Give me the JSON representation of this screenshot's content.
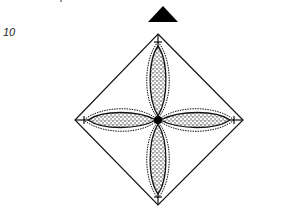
{
  "step": {
    "number": "10"
  },
  "diagram": {
    "type": "origami-fold-diagram",
    "indicator_icon": "filled-triangle-up",
    "petals": [
      "top",
      "right",
      "bottom",
      "left"
    ],
    "colors": {
      "line": "#111111",
      "fill": "#ffffff",
      "stipple": "#333333",
      "indicator": "#000000"
    }
  }
}
